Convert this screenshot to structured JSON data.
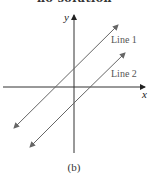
{
  "header": {
    "cut_title": "no solution"
  },
  "diagram": {
    "axes": {
      "x_label": "x",
      "y_label": "y",
      "color": "#333333"
    },
    "lines": [
      {
        "label": "Line 1",
        "color": "#666666"
      },
      {
        "label": "Line 2",
        "color": "#666666"
      }
    ],
    "caption": "(b)"
  }
}
